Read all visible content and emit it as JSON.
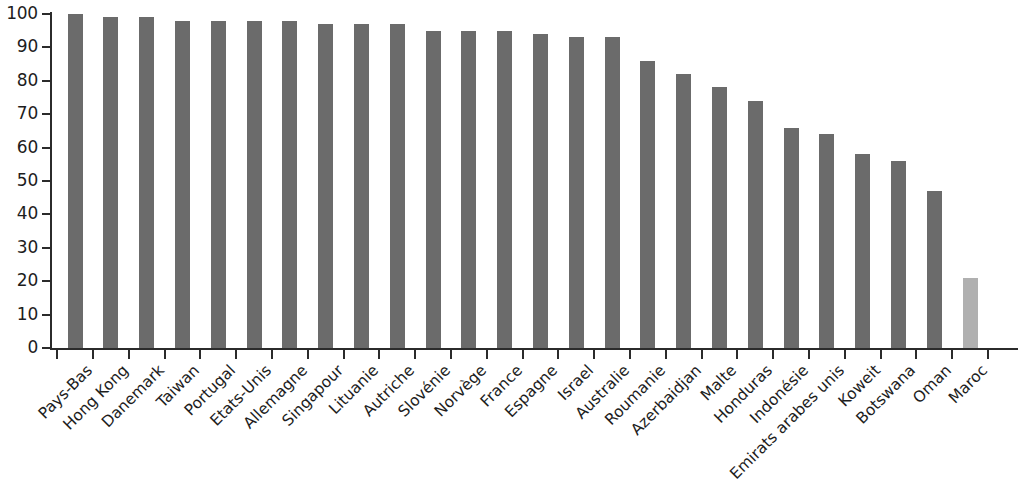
{
  "chart_data": {
    "type": "bar",
    "title": "",
    "subtitle": "",
    "xlabel": "",
    "ylabel": "",
    "ylim": [
      0,
      100
    ],
    "ytick_step": 10,
    "yticks": [
      100,
      90,
      80,
      70,
      60,
      50,
      40,
      30,
      20,
      10,
      0
    ],
    "grid": false,
    "legend": null,
    "legend_position": "none",
    "bar_color": "#6b6b6b",
    "highlight_color": "#b0b0b0",
    "highlight_categories": [
      "Maroc"
    ],
    "categories": [
      "Pays-Bas",
      "Hong Kong",
      "Danemark",
      "Taiwan",
      "Portugal",
      "Etats-Unis",
      "Allemagne",
      "Singapour",
      "Lituanie",
      "Autriche",
      "Slovénie",
      "Norvège",
      "France",
      "Espagne",
      "Israel",
      "Australie",
      "Roumanie",
      "Azerbaidjan",
      "Malte",
      "Honduras",
      "Indonésie",
      "Emirats arabes unis",
      "Koweit",
      "Botswana",
      "Oman",
      "Maroc"
    ],
    "values": [
      100,
      99,
      99,
      98,
      98,
      98,
      98,
      97,
      97,
      97,
      95,
      95,
      95,
      94,
      93,
      93,
      86,
      82,
      78,
      74,
      66,
      64,
      58,
      56,
      47,
      21
    ]
  }
}
